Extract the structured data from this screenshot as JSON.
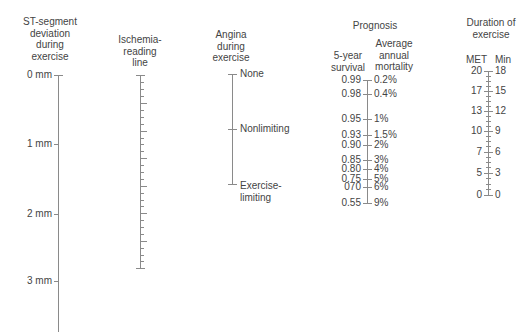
{
  "st_segment": {
    "title": [
      "ST-segment",
      "deviation",
      "during",
      "exercise"
    ],
    "ticks": [
      {
        "label": "0 mm",
        "y": 75
      },
      {
        "label": "1 mm",
        "y": 144
      },
      {
        "label": "2 mm",
        "y": 214
      },
      {
        "label": "3 mm",
        "y": 281
      }
    ]
  },
  "ischemia": {
    "title": [
      "Ischemia-",
      "reading",
      "line"
    ]
  },
  "angina": {
    "title": [
      "Angina",
      "during",
      "exercise"
    ],
    "ticks": [
      {
        "label": "None",
        "y": 74
      },
      {
        "label": "Nonlimiting",
        "y": 129
      },
      {
        "label": "Exercise-",
        "label2": "limiting",
        "y": 184
      }
    ]
  },
  "prognosis": {
    "title": "Prognosis",
    "left_header": [
      "5-year",
      "survival"
    ],
    "right_header": [
      "Average",
      "annual",
      "mortality"
    ],
    "ticks": [
      {
        "survival": "0.99",
        "mortality": "0.2%",
        "y": 80
      },
      {
        "survival": "0.98",
        "mortality": "0.4%",
        "y": 94
      },
      {
        "survival": "0.95",
        "mortality": "1%",
        "y": 119
      },
      {
        "survival": "0.93",
        "mortality": "1.5%",
        "y": 135
      },
      {
        "survival": "0.90",
        "mortality": "2%",
        "y": 145
      },
      {
        "survival": "0.85",
        "mortality": "3%",
        "y": 160
      },
      {
        "survival": "0.80",
        "mortality": "4%",
        "y": 169
      },
      {
        "survival": "0.75",
        "mortality": "5%",
        "y": 179
      },
      {
        "survival": "070",
        "mortality": "6%",
        "y": 187
      },
      {
        "survival": "0.55",
        "mortality": "9%",
        "y": 203
      }
    ]
  },
  "duration": {
    "title": [
      "Duration of",
      "exercise"
    ],
    "left_header": "MET",
    "right_header": "Min",
    "ticks": [
      {
        "met": "20",
        "min": "18",
        "y": 71
      },
      {
        "met": "17",
        "min": "15",
        "y": 91
      },
      {
        "met": "13",
        "min": "12",
        "y": 111
      },
      {
        "met": "10",
        "min": "9",
        "y": 131
      },
      {
        "met": "7",
        "min": "6",
        "y": 152
      },
      {
        "met": "5",
        "min": "3",
        "y": 173
      },
      {
        "met": "0",
        "min": "0",
        "y": 195
      }
    ]
  }
}
